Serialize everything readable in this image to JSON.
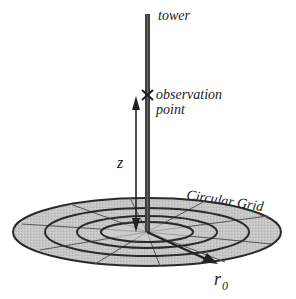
{
  "diagram": {
    "labels": {
      "tower": "tower",
      "observation_line1": "observation",
      "observation_line2": "point",
      "height": "z",
      "grid": "Circular Grid",
      "radius": "r",
      "radius_subscript": "0"
    },
    "colors": {
      "grid_fill": "#c4c4c4",
      "grid_stroke": "#2a2a2a",
      "tower": "#3a3a3a",
      "arrow": "#222222",
      "text": "#222222"
    },
    "grid": {
      "rings": 4,
      "radial_segments": 12
    }
  }
}
